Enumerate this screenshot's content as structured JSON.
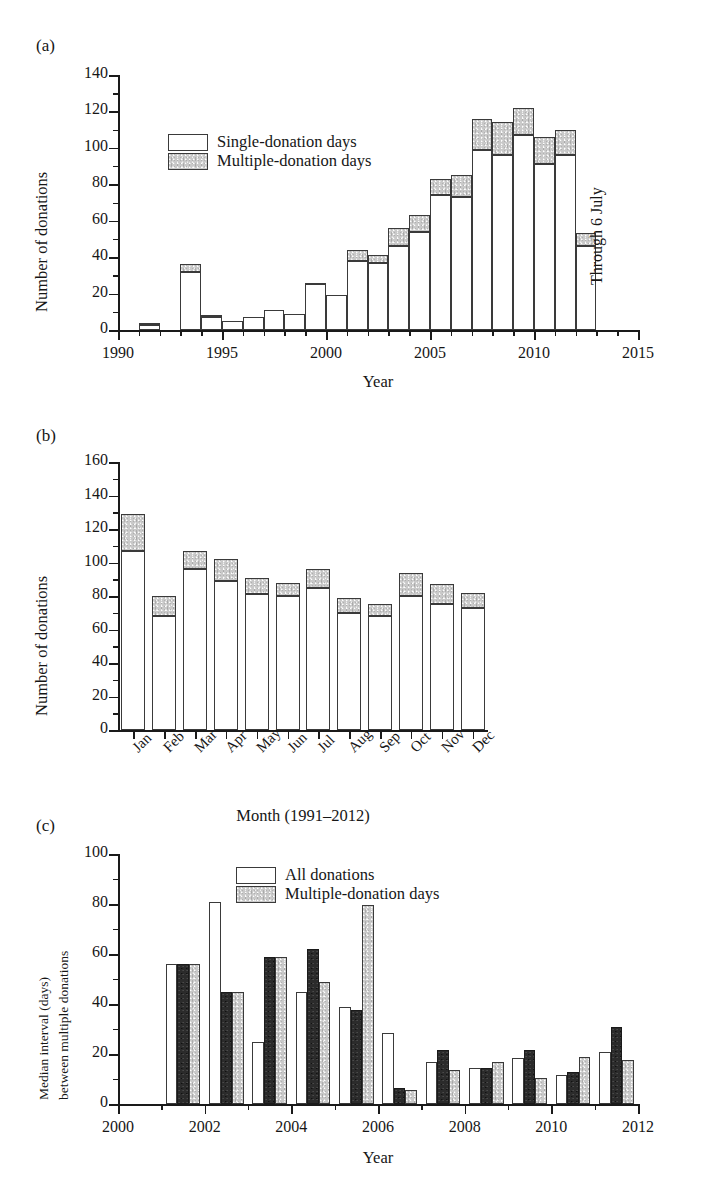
{
  "figure": {
    "panels": [
      "(a)",
      "(b)",
      "(c)"
    ]
  },
  "panel_a": {
    "letter": "(a)",
    "annotation": "Through 6 July",
    "legend": [
      {
        "label": "Single-donation days",
        "swatch": "white"
      },
      {
        "label": "Multiple-donation days",
        "swatch": "grey"
      }
    ],
    "chart_data": {
      "type": "bar",
      "stacked": true,
      "title": "",
      "xlabel": "Year",
      "ylabel": "Number of donations",
      "xlim": [
        1990,
        2015
      ],
      "ylim": [
        0,
        140
      ],
      "ytick_labels": [
        "0",
        "20",
        "40",
        "60",
        "80",
        "100",
        "120",
        "140"
      ],
      "ytick_values": [
        0,
        20,
        40,
        60,
        80,
        100,
        120,
        140
      ],
      "xtick_labels": [
        "1990",
        "1995",
        "2000",
        "2005",
        "2010",
        "2015"
      ],
      "xtick_values": [
        1990,
        1995,
        2000,
        2005,
        2010,
        2015
      ],
      "minor_ytick_step": 10,
      "minor_xtick_step": 1,
      "grid": false,
      "legend_position": "upper left",
      "categories": [
        1991,
        1993,
        1994,
        1995,
        1996,
        1997,
        1998,
        1999,
        2000,
        2001,
        2002,
        2003,
        2004,
        2005,
        2006,
        2007,
        2008,
        2009,
        2010,
        2011,
        2012
      ],
      "series": [
        {
          "name": "Single-donation days",
          "values": [
            3,
            32,
            7,
            5,
            7,
            11,
            9,
            25,
            19,
            38,
            37,
            46,
            54,
            74,
            73,
            99,
            96,
            107,
            91,
            96,
            46
          ]
        },
        {
          "name": "Multiple-donation days",
          "values": [
            1,
            4,
            1,
            0,
            0,
            0,
            0,
            1,
            0,
            6,
            4,
            10,
            9,
            9,
            12,
            17,
            18,
            15,
            15,
            14,
            7
          ]
        }
      ],
      "totals": [
        4,
        36,
        8,
        5,
        7,
        11,
        9,
        26,
        19,
        44,
        41,
        56,
        63,
        83,
        85,
        116,
        114,
        122,
        106,
        110,
        53
      ]
    }
  },
  "panel_b": {
    "letter": "(b)",
    "legend": [
      {
        "label": "All donations",
        "swatch": "white"
      },
      {
        "label": "Multiple-donation days",
        "swatch": "grey"
      }
    ],
    "chart_data": {
      "type": "bar",
      "stacked": true,
      "title": "",
      "xlabel": "Month (1991–2012)",
      "ylabel": "Number of donations",
      "ylim": [
        0,
        160
      ],
      "ytick_labels": [
        "0",
        "20",
        "40",
        "60",
        "80",
        "100",
        "120",
        "140",
        "160"
      ],
      "ytick_values": [
        0,
        20,
        40,
        60,
        80,
        100,
        120,
        140,
        160
      ],
      "minor_ytick_step": 10,
      "grid": false,
      "legend_position": "upper center",
      "categories": [
        "Jan",
        "Feb",
        "Mar",
        "Apr",
        "May",
        "Jun",
        "Jul",
        "Aug",
        "Sep",
        "Oct",
        "Nov",
        "Dec"
      ],
      "series": [
        {
          "name": "All donations",
          "values": [
            107,
            68,
            96,
            89,
            81,
            80,
            85,
            70,
            68,
            80,
            75,
            73
          ]
        },
        {
          "name": "Multiple-donation days",
          "values": [
            22,
            12,
            11,
            13,
            10,
            8,
            11,
            9,
            7,
            14,
            12,
            9
          ]
        }
      ],
      "totals": [
        129,
        80,
        107,
        102,
        91,
        88,
        96,
        79,
        75,
        94,
        87,
        82
      ]
    }
  },
  "panel_c": {
    "letter": "(c)",
    "legend": [
      {
        "label": "All multiple donations",
        "swatch": "white"
      },
      {
        "label": "Design criteria met",
        "swatch": "black"
      },
      {
        "label": "Design criteria relaxed",
        "swatch": "grey"
      }
    ],
    "chart_data": {
      "type": "bar",
      "stacked": false,
      "title": "",
      "xlabel": "Year",
      "ylabel_line1": "Median interval (days)",
      "ylabel_line2": "between multiple donations",
      "xlim": [
        2000,
        2012
      ],
      "ylim": [
        0,
        100
      ],
      "ytick_labels": [
        "0",
        "20",
        "40",
        "60",
        "80",
        "100"
      ],
      "ytick_values": [
        0,
        20,
        40,
        60,
        80,
        100
      ],
      "xtick_labels": [
        "2000",
        "2002",
        "2004",
        "2006",
        "2008",
        "2010",
        "2012"
      ],
      "xtick_values": [
        2000,
        2002,
        2004,
        2006,
        2008,
        2010,
        2012
      ],
      "minor_ytick_step": 10,
      "minor_xtick_step": 1,
      "grid": false,
      "legend_position": "upper right",
      "categories": [
        2001,
        2002,
        2003,
        2004,
        2005,
        2006,
        2007,
        2008,
        2009,
        2010,
        2011
      ],
      "series": [
        {
          "name": "All multiple donations",
          "values": [
            56,
            81,
            25,
            45,
            39,
            28.5,
            17,
            14.5,
            18.5,
            11.5,
            21
          ]
        },
        {
          "name": "Design criteria met",
          "values": [
            56,
            45,
            59,
            62,
            37.5,
            6.5,
            21.5,
            14.5,
            21.5,
            13,
            31
          ]
        },
        {
          "name": "Design criteria relaxed",
          "values": [
            56,
            45,
            59,
            49,
            79.5,
            5.5,
            13.5,
            17,
            10.5,
            19,
            17.5
          ]
        }
      ]
    }
  }
}
